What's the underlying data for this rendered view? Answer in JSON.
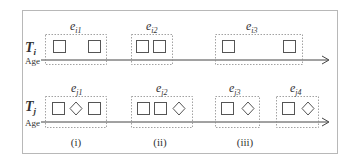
{
  "diagram": {
    "rows": [
      {
        "track_label": "T",
        "track_subscript": "i",
        "axis_label": "Age",
        "episodes": [
          {
            "label": "e",
            "subscript": "i1",
            "items": [
              "square",
              "square"
            ]
          },
          {
            "label": "e",
            "subscript": "i2",
            "items": [
              "square",
              "square"
            ]
          },
          {
            "label": "e",
            "subscript": "i3",
            "items": [
              "square",
              "square"
            ]
          }
        ]
      },
      {
        "track_label": "T",
        "track_subscript": "j",
        "axis_label": "Age",
        "episodes": [
          {
            "label": "e",
            "subscript": "j1",
            "items": [
              "square",
              "diamond",
              "square"
            ]
          },
          {
            "label": "e",
            "subscript": "j2",
            "items": [
              "square",
              "square",
              "diamond"
            ]
          },
          {
            "label": "e",
            "subscript": "j3",
            "items": [
              "square",
              "diamond"
            ]
          },
          {
            "label": "e",
            "subscript": "j4",
            "items": [
              "square",
              "diamond"
            ]
          }
        ]
      }
    ],
    "cases": [
      "(i)",
      "(ii)",
      "(iii)"
    ],
    "colors": {
      "border": "#b0b0b0",
      "dotted": "#8a8a8a",
      "shape": "#555555",
      "axis": "#444444",
      "text": "#333333"
    }
  }
}
